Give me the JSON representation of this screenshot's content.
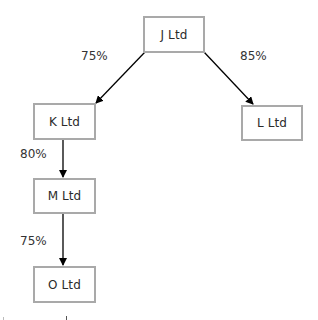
{
  "diagram": {
    "type": "ownership-structure",
    "nodes": [
      {
        "id": "J",
        "label": "J Ltd"
      },
      {
        "id": "K",
        "label": "K Ltd"
      },
      {
        "id": "L",
        "label": "L Ltd"
      },
      {
        "id": "M",
        "label": "M Ltd"
      },
      {
        "id": "O",
        "label": "O Ltd"
      }
    ],
    "edges": [
      {
        "from": "J",
        "to": "K",
        "label": "75%"
      },
      {
        "from": "J",
        "to": "L",
        "label": "85%"
      },
      {
        "from": "K",
        "to": "M",
        "label": "80%"
      },
      {
        "from": "M",
        "to": "O",
        "label": "75%"
      }
    ],
    "colors": {
      "box_border": "#a9a9a9",
      "text": "#2b2b2b",
      "arrow": "#000000",
      "background": "#ffffff"
    }
  }
}
